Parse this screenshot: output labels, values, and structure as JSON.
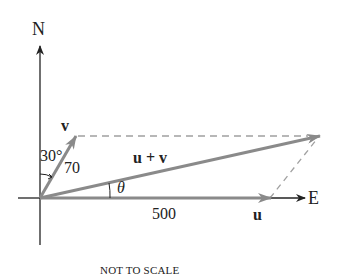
{
  "diagram": {
    "axes": {
      "north_label": "N",
      "east_label": "E"
    },
    "vectors": {
      "u": {
        "label": "u",
        "magnitude_label": "500"
      },
      "v": {
        "label": "v",
        "magnitude_label": "70",
        "angle_label": "30°"
      },
      "sum": {
        "label": "u + v",
        "angle_label": "θ"
      }
    },
    "caption": "NOT TO SCALE",
    "colors": {
      "axis": "#222222",
      "vector": "#8a8a8a",
      "dashed": "#a0a0a0",
      "text": "#222222"
    }
  }
}
